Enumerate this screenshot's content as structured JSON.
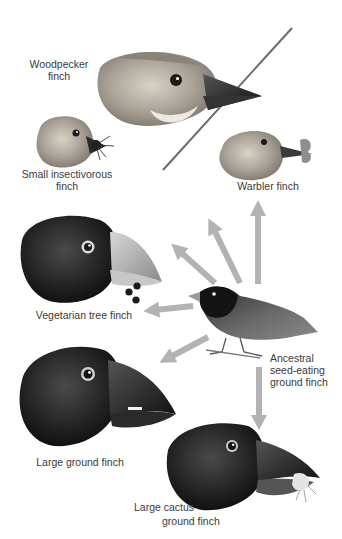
{
  "diagram": {
    "type": "adaptive-radiation-illustration",
    "arrow_color": "#b3b3b3",
    "center": {
      "id": "ancestral",
      "label_lines": [
        "Ancestral",
        "seed-eating",
        "ground finch"
      ]
    },
    "finches": [
      {
        "id": "woodpecker",
        "label_lines": [
          "Woodpecker",
          "finch"
        ]
      },
      {
        "id": "small-insectivorous",
        "label_lines": [
          "Small insectivorous",
          "finch"
        ]
      },
      {
        "id": "warbler",
        "label_lines": [
          "Warbler finch"
        ]
      },
      {
        "id": "vegetarian-tree",
        "label_lines": [
          "Vegetarian tree finch"
        ]
      },
      {
        "id": "large-ground",
        "label_lines": [
          "Large ground finch"
        ]
      },
      {
        "id": "large-cactus-ground",
        "label_lines": [
          "Large cactus",
          "ground finch"
        ]
      }
    ],
    "arrows": [
      {
        "from": "ancestral",
        "to": "warbler",
        "direction": "up"
      },
      {
        "from": "ancestral",
        "to": "woodpecker",
        "direction": "up-left"
      },
      {
        "from": "ancestral",
        "to": "small-insectivorous",
        "direction": "up-left"
      },
      {
        "from": "ancestral",
        "to": "vegetarian-tree",
        "direction": "left"
      },
      {
        "from": "ancestral",
        "to": "large-ground",
        "direction": "down-left"
      },
      {
        "from": "ancestral",
        "to": "large-cactus-ground",
        "direction": "down"
      }
    ]
  }
}
